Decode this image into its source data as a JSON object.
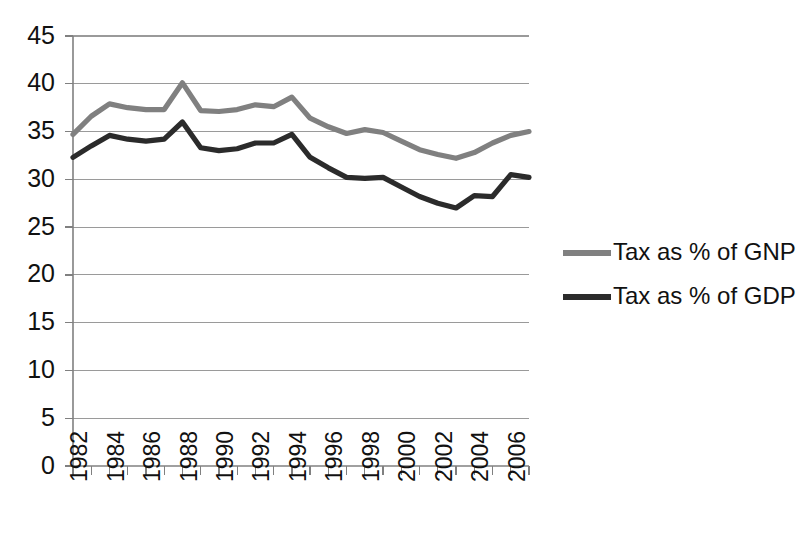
{
  "chart_data": {
    "type": "line",
    "title": "",
    "subtitle": "",
    "xlabel": "",
    "ylabel": "",
    "grid": true,
    "legend_position": "right",
    "ylim": [
      0,
      45
    ],
    "ytick_step": 5,
    "ytick_labels": [
      "0",
      "5",
      "10",
      "15",
      "20",
      "25",
      "30",
      "35",
      "40",
      "45"
    ],
    "ytick_values": [
      0,
      5,
      10,
      15,
      20,
      25,
      30,
      35,
      40,
      45
    ],
    "x": [
      1982,
      1983,
      1984,
      1985,
      1986,
      1987,
      1988,
      1989,
      1990,
      1991,
      1992,
      1993,
      1994,
      1995,
      1996,
      1997,
      1998,
      1999,
      2000,
      2001,
      2002,
      2003,
      2004,
      2005,
      2006,
      2007
    ],
    "xtick_labels": [
      "1982",
      "",
      "1984",
      "",
      "1986",
      "",
      "1988",
      "",
      "1990",
      "",
      "1992",
      "",
      "1994",
      "",
      "1996",
      "",
      "1998",
      "",
      "2000",
      "",
      "2002",
      "",
      "2004",
      "",
      "2006",
      ""
    ],
    "xlim": [
      1982,
      2007
    ],
    "series": [
      {
        "name": "Tax as % of GNP",
        "color": "#808080",
        "values": [
          34.7,
          36.6,
          37.9,
          37.5,
          37.3,
          37.3,
          40.1,
          37.2,
          37.1,
          37.3,
          37.8,
          37.6,
          38.6,
          36.4,
          35.5,
          34.8,
          35.2,
          34.9,
          34.0,
          33.1,
          32.6,
          32.2,
          32.8,
          33.8,
          34.6,
          35.0
        ]
      },
      {
        "name": "Tax as % of GDP",
        "color": "#2b2b2b",
        "values": [
          32.3,
          33.5,
          34.6,
          34.2,
          34.0,
          34.2,
          36.0,
          33.3,
          33.0,
          33.2,
          33.8,
          33.8,
          34.7,
          32.3,
          31.2,
          30.2,
          30.1,
          30.2,
          29.2,
          28.2,
          27.5,
          27.0,
          28.3,
          28.2,
          30.5,
          30.2
        ]
      }
    ],
    "legend": [
      {
        "label": "Tax as % of GNP",
        "color": "#808080"
      },
      {
        "label": "Tax as % of GDP",
        "color": "#2b2b2b"
      }
    ]
  }
}
